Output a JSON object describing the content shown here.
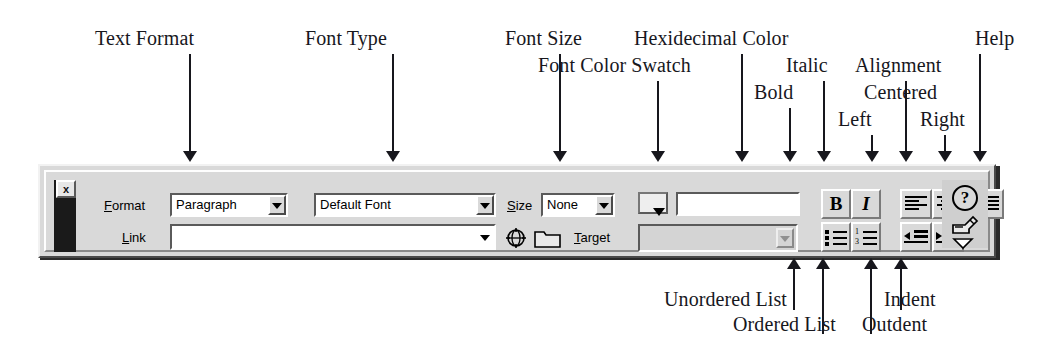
{
  "annotations": {
    "top": [
      {
        "id": "text-format",
        "label": "Text Format"
      },
      {
        "id": "font-type",
        "label": "Font Type"
      },
      {
        "id": "font-size",
        "label": "Font Size"
      },
      {
        "id": "font-color-swatch",
        "label": "Font Color Swatch"
      },
      {
        "id": "hexidecimal-color",
        "label": "Hexidecimal Color"
      },
      {
        "id": "bold",
        "label": "Bold"
      },
      {
        "id": "italic",
        "label": "Italic"
      },
      {
        "id": "alignment",
        "label": "Alignment"
      },
      {
        "id": "centered",
        "label": "Centered"
      },
      {
        "id": "left",
        "label": "Left"
      },
      {
        "id": "right",
        "label": "Right"
      },
      {
        "id": "help",
        "label": "Help"
      }
    ],
    "bottom": [
      {
        "id": "unordered-list",
        "label": "Unordered List"
      },
      {
        "id": "ordered-list",
        "label": "Ordered List"
      },
      {
        "id": "outdent",
        "label": "Outdent"
      },
      {
        "id": "indent",
        "label": "Indent"
      }
    ]
  },
  "toolbar": {
    "close_button": "x",
    "row1": {
      "format_label": "Format",
      "format_label_accel": "F",
      "format_value": "Paragraph",
      "font_value": "Default Font",
      "size_label": "Size",
      "size_label_accel": "S",
      "size_value": "None",
      "color_swatch_value": "",
      "hex_color_value": ""
    },
    "row2": {
      "link_label": "Link",
      "link_label_accel": "L",
      "link_value": "",
      "target_label": "Target",
      "target_label_accel": "T",
      "target_value": ""
    },
    "buttons": {
      "bold": "B",
      "italic": "I",
      "align_left": "align-left",
      "align_center": "align-center",
      "align_right": "align-right",
      "unordered_list": "unordered-list",
      "ordered_list": "ordered-list",
      "outdent": "outdent",
      "indent": "indent",
      "help": "?"
    },
    "ordered_list_numbers": [
      "1",
      "3"
    ],
    "icons": {
      "globe": "globe-target-icon",
      "folder": "folder-icon",
      "help": "help-icon",
      "edit_stamp": "edit-stamp-icon",
      "more": "more-chevron-icon"
    }
  },
  "colors": {
    "page_background": "#ffffff",
    "toolbar_face": "#d9d9d9",
    "toolbar_highlight": "#ffffff",
    "toolbar_shadow": "#4a4a4a",
    "field_background": "#ffffff",
    "disabled_field_background": "#d4d4d4",
    "ink": "#17171d",
    "gripper": "#1a1a1a"
  }
}
